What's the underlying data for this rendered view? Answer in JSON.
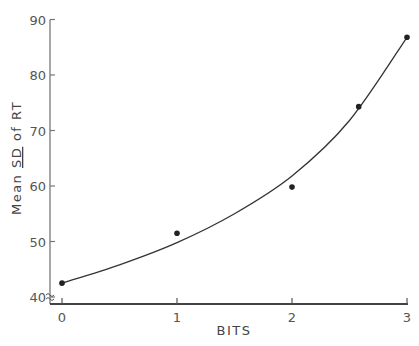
{
  "chart_data": {
    "type": "scatter",
    "title": "",
    "xlabel": "BITS",
    "ylabel": "Mean SD of RT",
    "ylabel_parts": {
      "prefix": "Mean ",
      "underlined": "SD",
      "suffix": " of RT"
    },
    "xlim": [
      0,
      3
    ],
    "ylim": [
      40,
      90
    ],
    "x_ticks": [
      0,
      1,
      2,
      3
    ],
    "y_ticks": [
      40,
      50,
      60,
      70,
      80,
      90
    ],
    "grid": false,
    "legend": null,
    "axis_break": true,
    "series": [
      {
        "name": "observed",
        "marker": "filled-circle",
        "points": [
          {
            "x": 0,
            "y": 42.5
          },
          {
            "x": 1,
            "y": 51.5
          },
          {
            "x": 2,
            "y": 59.8
          },
          {
            "x": 2.58,
            "y": 74.3
          },
          {
            "x": 3,
            "y": 86.8
          }
        ]
      },
      {
        "name": "fitted-curve",
        "style": "line",
        "points": [
          {
            "x": 0,
            "y": 42.5
          },
          {
            "x": 0.5,
            "y": 45.8
          },
          {
            "x": 1,
            "y": 49.8
          },
          {
            "x": 1.5,
            "y": 55.0
          },
          {
            "x": 2,
            "y": 61.8
          },
          {
            "x": 2.5,
            "y": 71.8
          },
          {
            "x": 3,
            "y": 86.8
          }
        ]
      }
    ],
    "colors": {
      "ink": "#333333",
      "background": "#ffffff"
    }
  }
}
